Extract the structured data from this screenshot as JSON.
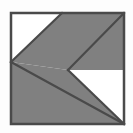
{
  "figure": {
    "title": "Abstract K Shape",
    "description": "Square outlined panel containing a letter-K-like arrangement of gray and white triangles",
    "canvas": {
      "width": 133,
      "height": 133
    },
    "colors": {
      "background": "#fdfdfd",
      "fill_gray": "#808080",
      "fill_white": "#ffffff",
      "stroke_dark": "#4a4a4a",
      "frame_stroke": "#4a4a4a"
    },
    "frame": {
      "name": "outer-square-frame",
      "x": 11,
      "y": 13,
      "width": 113,
      "height": 111,
      "stroke_width": 2.5
    },
    "vertex": {
      "x": 68,
      "y": 70
    },
    "shapes": [
      {
        "name": "gray-diagonal-band",
        "fill": "#808080",
        "points": "62,13 124,13 68,70 124,124 92,124 11,62 11,124 124,124"
      },
      {
        "name": "upper-right-gray-triangle",
        "fill": "#808080",
        "points": "62,13 124,13 124,70"
      },
      {
        "name": "lower-left-gray-triangle",
        "fill": "#808080",
        "points": "11,62 68,70 124,124 11,124"
      },
      {
        "name": "upper-left-white-triangle",
        "fill": "#ffffff",
        "points": "11,13 62,13 11,62"
      },
      {
        "name": "lower-right-white-triangle",
        "fill": "#ffffff",
        "points": "68,70 124,70 124,124"
      }
    ],
    "edges": [
      {
        "name": "upper-left-diagonal",
        "x1": 11,
        "y1": 62,
        "x2": 62,
        "y2": 13
      },
      {
        "name": "band-inner-diagonal",
        "x1": 68,
        "y1": 70,
        "x2": 124,
        "y2": 13
      },
      {
        "name": "lower-diagonal",
        "x1": 68,
        "y1": 70,
        "x2": 124,
        "y2": 124
      },
      {
        "name": "band-lower-edge",
        "x1": 11,
        "y1": 62,
        "x2": 124,
        "y2": 124
      }
    ]
  }
}
